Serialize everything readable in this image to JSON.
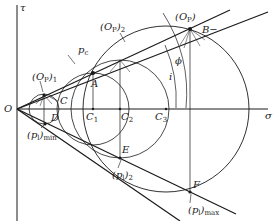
{
  "diagram": {
    "type": "mohr-circle-construction",
    "colors": {
      "ink": "#1a1a1a",
      "background": "#ffffff",
      "thin_line": "#444444"
    },
    "axes": {
      "x_label": "σ",
      "y_label": "τ",
      "origin_label": "O"
    },
    "labels": {
      "Op1": "(O",
      "Op1_sub_p": "P",
      "Op1_sub": "1",
      "Op2": "(O",
      "Op2_sub_p": "P",
      "Op2_sub": "2",
      "Op": "(O",
      "Op_sub_p": "P",
      "pc": "p",
      "pc_sub": "c",
      "A": "A",
      "B": "B",
      "B_sup": "−",
      "C": "C",
      "C1": "C",
      "C1_sub": "1",
      "C2": "C",
      "C2_sub": "2",
      "C3": "C",
      "C3_sub": "3",
      "D": "D",
      "E": "E",
      "F": "F",
      "phi": "ϕ",
      "i": "i",
      "pl_min": "(p",
      "pl_min_sub_l": "l",
      "pl_min_sub": "min",
      "pl2": "(p",
      "pl2_sub_l": "l",
      "pl2_sub": "2",
      "pl_max": "(p",
      "pl_max_sub_l": "l",
      "pl_max_sub": "max"
    }
  }
}
